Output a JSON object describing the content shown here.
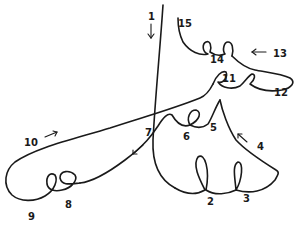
{
  "diagram": {
    "labels": [
      {
        "id": "1",
        "text": "1",
        "x": 148,
        "y": 20
      },
      {
        "id": "2",
        "text": "2",
        "x": 207,
        "y": 205
      },
      {
        "id": "3",
        "text": "3",
        "x": 243,
        "y": 202
      },
      {
        "id": "4",
        "text": "4",
        "x": 257,
        "y": 150
      },
      {
        "id": "5",
        "text": "5",
        "x": 210,
        "y": 131
      },
      {
        "id": "6",
        "text": "6",
        "x": 183,
        "y": 140
      },
      {
        "id": "7",
        "text": "7",
        "x": 145,
        "y": 136
      },
      {
        "id": "8",
        "text": "8",
        "x": 65,
        "y": 208
      },
      {
        "id": "9",
        "text": "9",
        "x": 28,
        "y": 220
      },
      {
        "id": "10",
        "text": "10",
        "x": 24,
        "y": 146
      },
      {
        "id": "11",
        "text": "11",
        "x": 222,
        "y": 82
      },
      {
        "id": "12",
        "text": "12",
        "x": 274,
        "y": 96
      },
      {
        "id": "13",
        "text": "13",
        "x": 273,
        "y": 57
      },
      {
        "id": "14",
        "text": "14",
        "x": 210,
        "y": 63
      },
      {
        "id": "15",
        "text": "15",
        "x": 178,
        "y": 27
      }
    ],
    "stroke_color": "#1a1a1a",
    "background": "#ffffff"
  }
}
